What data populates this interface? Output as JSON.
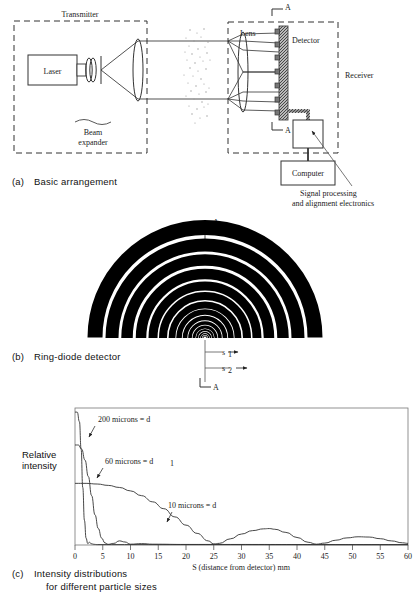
{
  "figure": {
    "panels": [
      {
        "tag": "(a)",
        "caption": "Basic arrangement"
      },
      {
        "tag": "(b)",
        "caption": "Ring-diode detector"
      },
      {
        "tag": "(c)",
        "caption_line1": "Intensity distributions",
        "caption_line2": "for different particle sizes"
      }
    ]
  },
  "panel_a": {
    "transmitter_label": "Transmitter",
    "receiver_label": "Receiver",
    "laser_label": "Laser",
    "beam_expander_line1": "Beam",
    "beam_expander_line2": "expander",
    "lens_label": "Lens",
    "detector_label": "Detector",
    "computer_label": "Computer",
    "electronics_line1": "Signal processing",
    "electronics_line2": "and alignment electronics",
    "section_mark_top": "A",
    "section_mark_bottom": "A"
  },
  "panel_b": {
    "section_mark_top": "A",
    "section_mark_bottom": "A",
    "dim_label_1": "s",
    "dim_sub_1": "1",
    "dim_label_2": "s",
    "dim_sub_2": "2",
    "ring_count": 16
  },
  "chart_data": {
    "type": "line",
    "title": "",
    "xlabel": "S (distance from detector) mm",
    "ylabel_line1": "Relative",
    "ylabel_line2": "intensity",
    "xlim": [
      0,
      60
    ],
    "ylim": [
      0,
      1.0
    ],
    "xticks": [
      0,
      5,
      10,
      15,
      20,
      25,
      30,
      35,
      40,
      45,
      50,
      55,
      60
    ],
    "xticklabels": [
      "0",
      "5",
      "10",
      "15",
      "20",
      "25",
      "30",
      "35",
      "40",
      "45",
      "50",
      "55",
      "60"
    ],
    "yticks": [],
    "grid": false,
    "legend": "none",
    "annotations": [
      {
        "text": "200 microns = d",
        "x": 4.2,
        "y": 0.9
      },
      {
        "text": "60 microns = d",
        "sub": "1",
        "x": 5.5,
        "y": 0.6
      },
      {
        "text": "10 microns = d",
        "x": 24.0,
        "y": 0.26
      }
    ],
    "series": [
      {
        "name": "200 microns = d",
        "points": [
          [
            0,
            0.97
          ],
          [
            0.4,
            0.97
          ],
          [
            0.8,
            0.9
          ],
          [
            1.1,
            0.7
          ],
          [
            1.4,
            0.42
          ],
          [
            1.7,
            0.18
          ],
          [
            2.0,
            0.05
          ],
          [
            2.3,
            0.01
          ],
          [
            2.6,
            0.02
          ],
          [
            2.9,
            0.01
          ],
          [
            3.4,
            0.005
          ],
          [
            4.0,
            0.003
          ],
          [
            60,
            0.002
          ]
        ]
      },
      {
        "name": "60 microns = d1",
        "points": [
          [
            0,
            0.73
          ],
          [
            0.6,
            0.73
          ],
          [
            1.2,
            0.7
          ],
          [
            1.8,
            0.62
          ],
          [
            2.4,
            0.5
          ],
          [
            3.0,
            0.36
          ],
          [
            3.6,
            0.22
          ],
          [
            4.2,
            0.12
          ],
          [
            4.8,
            0.05
          ],
          [
            5.4,
            0.015
          ],
          [
            6.0,
            0.005
          ],
          [
            7.0,
            0.012
          ],
          [
            8.0,
            0.03
          ],
          [
            9.0,
            0.022
          ],
          [
            10.0,
            0.006
          ],
          [
            12.0,
            0.01
          ],
          [
            14.0,
            0.006
          ],
          [
            20.0,
            0.004
          ],
          [
            60,
            0.003
          ]
        ]
      },
      {
        "name": "10 microns = d",
        "points": [
          [
            0,
            0.45
          ],
          [
            2,
            0.45
          ],
          [
            4,
            0.445
          ],
          [
            6,
            0.435
          ],
          [
            8,
            0.42
          ],
          [
            10,
            0.395
          ],
          [
            12,
            0.36
          ],
          [
            14,
            0.315
          ],
          [
            16,
            0.265
          ],
          [
            18,
            0.205
          ],
          [
            20,
            0.145
          ],
          [
            22,
            0.085
          ],
          [
            24,
            0.03
          ],
          [
            25,
            0.008
          ],
          [
            26,
            0.012
          ],
          [
            28,
            0.045
          ],
          [
            30,
            0.08
          ],
          [
            32,
            0.105
          ],
          [
            34,
            0.118
          ],
          [
            35,
            0.12
          ],
          [
            36,
            0.115
          ],
          [
            38,
            0.092
          ],
          [
            40,
            0.055
          ],
          [
            42,
            0.02
          ],
          [
            43.5,
            0.006
          ],
          [
            45,
            0.014
          ],
          [
            47,
            0.035
          ],
          [
            49,
            0.052
          ],
          [
            51,
            0.06
          ],
          [
            53,
            0.058
          ],
          [
            55,
            0.046
          ],
          [
            57,
            0.03
          ],
          [
            59,
            0.016
          ],
          [
            60,
            0.012
          ]
        ]
      }
    ]
  }
}
